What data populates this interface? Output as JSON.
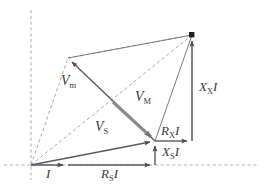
{
  "figure": {
    "kind": "phasor-diagram",
    "title": "",
    "background_color": "#ffffff",
    "width": 270,
    "height": 188
  },
  "colors": {
    "solid_line": "#4a4a4a",
    "dashed_line": "#9a9a9a",
    "thick_highlight": "#8a8a8a",
    "axis_dashed": "#b4b4b4",
    "label_text": "#3a3a3a",
    "node_marker": "#1a1a1a"
  },
  "axes": {
    "horizontal": {
      "name": "horizontal-reference-axis",
      "style": "dashed",
      "x1": 4,
      "y1": 165,
      "x2": 258,
      "y2": 165
    },
    "vertical": {
      "name": "vertical-reference-axis",
      "style": "dashed",
      "x1": 31,
      "y1": 10,
      "x2": 31,
      "y2": 180
    }
  },
  "points": {
    "origin": {
      "name": "origin-node",
      "x": 31,
      "y": 165
    },
    "i_tip": {
      "name": "current-arrow-tip",
      "x": 68,
      "y": 165
    },
    "rs_tip": {
      "name": "rs-i-arrow-tip",
      "x": 155,
      "y": 165
    },
    "vs_tip": {
      "name": "vs-phasor-tip",
      "x": 155,
      "y": 141
    },
    "vm_tip": {
      "name": "vm-phasor-tip",
      "x": 68,
      "y": 58
    },
    "top_right": {
      "name": "vmm-resultant-node",
      "x": 192,
      "y": 35
    },
    "cross": {
      "name": "phasor-crossing",
      "x": 113,
      "y": 102
    },
    "rx_tip": {
      "name": "rx-i-arrow-tip",
      "x": 192,
      "y": 141
    }
  },
  "vectors": [
    {
      "key": "I",
      "name": "current-phasor-I",
      "label": "I",
      "label_html": "<span class=\"it\">I</span>",
      "style": "solid",
      "weight": "thin",
      "arrow": true,
      "x1": 31,
      "y1": 165,
      "x2": 68,
      "y2": 165
    },
    {
      "key": "RsI",
      "name": "resistive-drop-RsI",
      "label": "RsI",
      "label_html": "<span class=\"it\">R</span><sub>S</sub><span class=\"it\">I</span>",
      "style": "solid",
      "weight": "thin",
      "arrow": true,
      "x1": 68,
      "y1": 165,
      "x2": 155,
      "y2": 165
    },
    {
      "key": "XsI",
      "name": "reactive-drop-XsI",
      "label": "XsI",
      "label_html": "<span class=\"it\">X</span><sub>S</sub><span class=\"it\">I</span>",
      "style": "solid",
      "weight": "thin",
      "arrow": true,
      "x1": 155,
      "y1": 165,
      "x2": 155,
      "y2": 141
    },
    {
      "key": "Vs",
      "name": "source-voltage-phasor-Vs",
      "label": "VS",
      "label_html": "<span class=\"it\">V</span><sub>S</sub>",
      "style": "solid",
      "weight": "thin",
      "arrow": true,
      "x1": 31,
      "y1": 165,
      "x2": 155,
      "y2": 141
    },
    {
      "key": "RxI",
      "name": "unknown-resistive-drop-RxI",
      "label": "RxI",
      "label_html": "<span class=\"it\">R</span><sub>X</sub><span class=\"it\">I</span>",
      "style": "solid",
      "weight": "thin",
      "arrow": true,
      "x1": 155,
      "y1": 141,
      "x2": 192,
      "y2": 141
    },
    {
      "key": "XxI",
      "name": "unknown-reactive-drop-XxI",
      "label": "XxI",
      "label_html": "<span class=\"it\">X</span><sub>X</sub><span class=\"it\">I</span>",
      "style": "solid",
      "weight": "thin",
      "arrow": true,
      "x1": 192,
      "y1": 141,
      "x2": 192,
      "y2": 35
    },
    {
      "key": "VM",
      "name": "meter-voltage-phasor-VM",
      "label": "VM",
      "label_html": "<span class=\"it\">V</span><sub>M</sub>",
      "style": "solid",
      "weight": "thick",
      "arrow": true,
      "x1": 113,
      "y1": 102,
      "x2": 155,
      "y2": 141
    },
    {
      "key": "Vm",
      "name": "magnetizing-voltage-phasor-Vm",
      "label": "Vm",
      "label_html": "<span class=\"it\">V</span><sub>m</sub>",
      "style": "solid",
      "weight": "thin",
      "arrow": true,
      "x1": 155,
      "y1": 141,
      "x2": 68,
      "y2": 58
    }
  ],
  "construction_lines": [
    {
      "name": "dashed-origin-to-vm-tip",
      "style": "dashed",
      "x1": 31,
      "y1": 165,
      "x2": 68,
      "y2": 58
    },
    {
      "name": "dashed-vm-tip-to-top-right",
      "style": "dashed",
      "x1": 68,
      "y1": 58,
      "x2": 192,
      "y2": 35
    },
    {
      "name": "dashed-origin-to-top-right",
      "style": "dashed",
      "x1": 31,
      "y1": 165,
      "x2": 192,
      "y2": 35
    },
    {
      "name": "dashed-vs-tip-to-top-right",
      "style": "solid",
      "x1": 155,
      "y1": 141,
      "x2": 192,
      "y2": 35
    },
    {
      "name": "solid-vm-tip-to-top-right",
      "style": "solid",
      "x1": 68,
      "y1": 58,
      "x2": 192,
      "y2": 35
    }
  ],
  "labels": [
    {
      "name": "label-Vm",
      "text": "Vm",
      "html": "<span class=\"it\">V</span><sub>m</sub>",
      "x": 61,
      "y": 81,
      "size": 14
    },
    {
      "name": "label-VM",
      "text": "VM",
      "html": "<span class=\"it\">V</span><sub>M</sub>",
      "x": 135,
      "y": 97,
      "size": 14
    },
    {
      "name": "label-VS",
      "text": "VS",
      "html": "<span class=\"it\">V</span><sub>S</sub>",
      "x": 95,
      "y": 127,
      "size": 14
    },
    {
      "name": "label-I",
      "text": "I",
      "html": "<span class=\"it\">I</span>",
      "x": 46,
      "y": 167,
      "size": 13
    },
    {
      "name": "label-RsI",
      "text": "RsI",
      "html": "<span class=\"it\">R</span><sub>S</sub><span class=\"it\">I</span>",
      "x": 102,
      "y": 167,
      "size": 13
    },
    {
      "name": "label-XsI",
      "text": "XsI",
      "html": "<span class=\"it\">X</span><sub>S</sub><span class=\"it\">I</span>",
      "x": 162,
      "y": 146,
      "size": 13
    },
    {
      "name": "label-RxI",
      "text": "RxI",
      "html": "<span class=\"it\">R</span><sub>X</sub><span class=\"it\">I</span>",
      "x": 161,
      "y": 125,
      "size": 13
    },
    {
      "name": "label-XxI",
      "text": "XxI",
      "html": "<span class=\"it\">X</span><sub>X</sub><span class=\"it\">I</span>",
      "x": 199,
      "y": 83,
      "size": 13
    }
  ]
}
